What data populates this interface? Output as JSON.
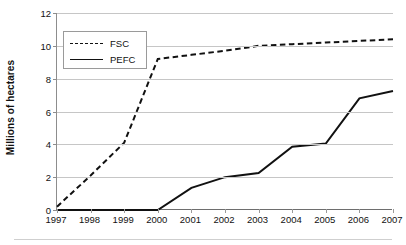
{
  "chart_data": {
    "type": "line",
    "title": "",
    "subtitle": "",
    "xlabel": "",
    "ylabel": "Millions of hectares",
    "categories": [
      "1997",
      "1998",
      "1999",
      "2000",
      "2001",
      "2002",
      "2003",
      "2004",
      "2005",
      "2006",
      "2007"
    ],
    "series": [
      {
        "name": "FSC",
        "style": "dashed",
        "color": "#111111",
        "values": [
          0.2,
          2.1,
          4.1,
          9.2,
          9.45,
          9.7,
          10.0,
          10.1,
          10.2,
          10.3,
          10.4
        ]
      },
      {
        "name": "PEFC",
        "style": "solid",
        "color": "#111111",
        "values": [
          0.0,
          0.0,
          0.0,
          0.0,
          1.35,
          2.0,
          2.25,
          3.85,
          4.05,
          6.8,
          7.25
        ]
      }
    ],
    "ylim": [
      0,
      12
    ],
    "yticks": [
      0,
      2,
      4,
      6,
      8,
      10,
      12
    ],
    "ytick_labels": [
      "0",
      "2",
      "4",
      "6",
      "8",
      "10",
      "12"
    ],
    "grid": "horizontal",
    "legend_position": "top-left",
    "legend_entries": [
      "FSC",
      "PEFC"
    ]
  },
  "legend": {
    "items": [
      {
        "label": "FSC",
        "swatch": "dashed-line-swatch"
      },
      {
        "label": "PEFC",
        "swatch": "solid-line-swatch"
      }
    ]
  }
}
